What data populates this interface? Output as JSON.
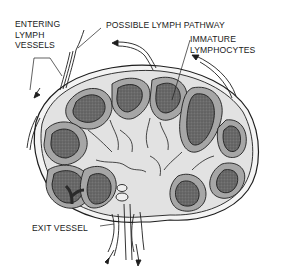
{
  "diagram": {
    "labels": {
      "entering_lymph_vessels": "ENTERING\nLYMPH\nVESSELS",
      "possible_lymph_pathway": "POSSIBLE LYMPH PATHWAY",
      "immature_lymphocytes": "IMMATURE\nLYMPHOCYTES",
      "exit_vessel": "EXIT VESSEL"
    },
    "colors": {
      "outline": "#1e1e1e",
      "capsule_fill": "#f2f2f2",
      "cortex_medium": "#9a9a9a",
      "cortex_dark": "#5e5e5e",
      "medulla_light": "#d6d6d6",
      "background": "#ffffff"
    }
  }
}
